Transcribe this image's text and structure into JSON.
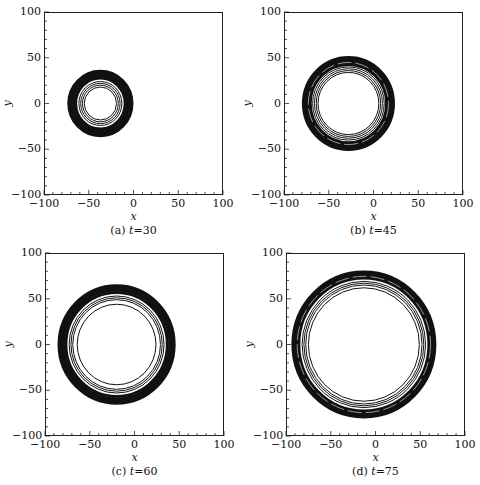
{
  "figure": {
    "panels": [
      {
        "id": "a",
        "caption_prefix": "(a)",
        "caption_var": "t",
        "caption_eq": "=30"
      },
      {
        "id": "b",
        "caption_prefix": "(b)",
        "caption_var": "t",
        "caption_eq": "=45"
      },
      {
        "id": "c",
        "caption_prefix": "(c)",
        "caption_var": "t",
        "caption_eq": "=60"
      },
      {
        "id": "d",
        "caption_prefix": "(d)",
        "caption_var": "t",
        "caption_eq": "=75"
      }
    ],
    "xlabel": "x",
    "ylabel": "y",
    "xticks": [
      "−100",
      "−50",
      "0",
      "50",
      "100"
    ],
    "yticks": [
      "100",
      "50",
      "0",
      "−50",
      "−100"
    ]
  },
  "chart_data": [
    {
      "type": "contour",
      "title": "(a) t=30",
      "xlabel": "x",
      "ylabel": "y",
      "xlim": [
        -100,
        100
      ],
      "ylim": [
        -100,
        100
      ],
      "xticks": [
        -100,
        -50,
        0,
        50,
        100
      ],
      "yticks": [
        -100,
        -50,
        0,
        50,
        100
      ],
      "grid": false,
      "center": [
        -37,
        0
      ],
      "band_outer_radius": 37,
      "band_inner_radius": 26,
      "rings": [
        18,
        20,
        22,
        24,
        29,
        31
      ]
    },
    {
      "type": "contour",
      "title": "(b) t=45",
      "xlabel": "x",
      "ylabel": "y",
      "xlim": [
        -100,
        100
      ],
      "ylim": [
        -100,
        100
      ],
      "xticks": [
        -100,
        -50,
        0,
        50,
        100
      ],
      "yticks": [
        -100,
        -50,
        0,
        50,
        100
      ],
      "grid": false,
      "center": [
        -28,
        0
      ],
      "band_outer_radius": 52,
      "band_inner_radius": 41,
      "rings": [
        34,
        36,
        38,
        40
      ]
    },
    {
      "type": "contour",
      "title": "(c) t=60",
      "xlabel": "x",
      "ylabel": "y",
      "xlim": [
        -100,
        100
      ],
      "ylim": [
        -100,
        100
      ],
      "xticks": [
        -100,
        -50,
        0,
        50,
        100
      ],
      "yticks": [
        -100,
        -50,
        0,
        50,
        100
      ],
      "grid": false,
      "center": [
        -20,
        0
      ],
      "band_outer_radius": 66,
      "band_inner_radius": 55,
      "rings": [
        44,
        49,
        51,
        53,
        59,
        61
      ]
    },
    {
      "type": "contour",
      "title": "(d) t=75",
      "xlabel": "x",
      "ylabel": "y",
      "xlim": [
        -100,
        100
      ],
      "ylim": [
        -100,
        100
      ],
      "xticks": [
        -100,
        -50,
        0,
        50,
        100
      ],
      "yticks": [
        -100,
        -50,
        0,
        50,
        100
      ],
      "grid": false,
      "center": [
        -13,
        0
      ],
      "band_outer_radius": 81,
      "band_inner_radius": 71,
      "rings": [
        62,
        65,
        67,
        69
      ]
    }
  ]
}
